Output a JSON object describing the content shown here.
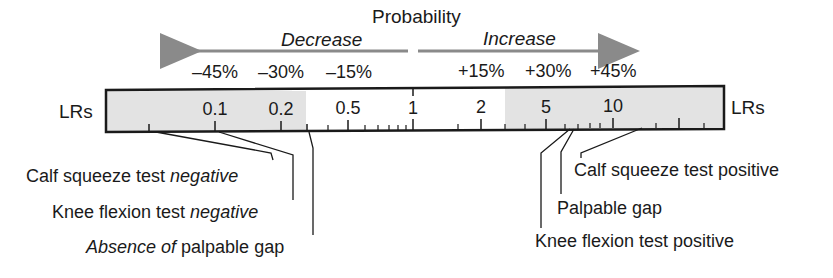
{
  "diagram": {
    "title": "Probability",
    "decrease_label": "Decrease",
    "increase_label": "Increase",
    "left_axis_label": "LRs",
    "right_axis_label": "LRs",
    "percent_labels": [
      {
        "text": "–45%",
        "x": 192
      },
      {
        "text": "–30%",
        "x": 258
      },
      {
        "text": "–15%",
        "x": 326
      },
      {
        "text": "+15%",
        "x": 458
      },
      {
        "text": "+30%",
        "x": 525
      },
      {
        "text": "+45%",
        "x": 590
      }
    ],
    "lr_ticks": [
      {
        "label": "0.1",
        "x": 215
      },
      {
        "label": "0.2",
        "x": 281
      },
      {
        "label": "0.5",
        "x": 348
      },
      {
        "label": "1",
        "x": 413
      },
      {
        "label": "2",
        "x": 481
      },
      {
        "label": "5",
        "x": 546
      },
      {
        "label": "10",
        "x": 613
      }
    ],
    "shading": {
      "gray_color": "#e3e3e3",
      "left_region_end_lr": "~0.3",
      "right_region_start_lr": "~3"
    },
    "callouts_negative": [
      {
        "text_plain": "Calf squeeze test ",
        "text_italic": "negative",
        "lr_approx": 0.05
      },
      {
        "text_plain": "Knee flexion test ",
        "text_italic": "negative",
        "lr_approx": 0.1
      },
      {
        "text_italic": "Absence of",
        "text_plain": " palpable gap",
        "lr_approx": 0.3
      }
    ],
    "callouts_positive": [
      {
        "text": "Calf squeeze test positive",
        "lr_approx": 13
      },
      {
        "text": "Palpable gap",
        "lr_approx": 7
      },
      {
        "text": "Knee flexion test positive",
        "lr_approx": 6.5
      }
    ]
  }
}
